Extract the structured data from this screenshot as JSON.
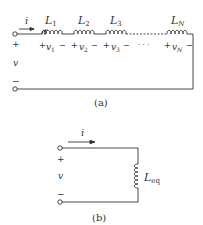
{
  "figure_a": {
    "caption": "(a)",
    "current_label": "i",
    "source_voltage": {
      "label": "v",
      "plus": "+",
      "minus": "−"
    },
    "inductors": [
      {
        "name": "L",
        "sub": "1",
        "voltage": "v",
        "vsub": "1"
      },
      {
        "name": "L",
        "sub": "2",
        "voltage": "v",
        "vsub": "2"
      },
      {
        "name": "L",
        "sub": "3",
        "voltage": "v",
        "vsub": "3"
      },
      {
        "name": "L",
        "sub": "N",
        "voltage": "v",
        "vsub": "N"
      }
    ],
    "ellipsis": "· · ·",
    "plus": "+",
    "minus": "−"
  },
  "figure_b": {
    "caption": "(b)",
    "current_label": "i",
    "source_voltage": {
      "label": "v",
      "plus": "+",
      "minus": "−"
    },
    "inductor": {
      "name": "L",
      "sub": "eq"
    }
  },
  "colors": {
    "stroke": "#333333",
    "background": "#ffffff"
  }
}
